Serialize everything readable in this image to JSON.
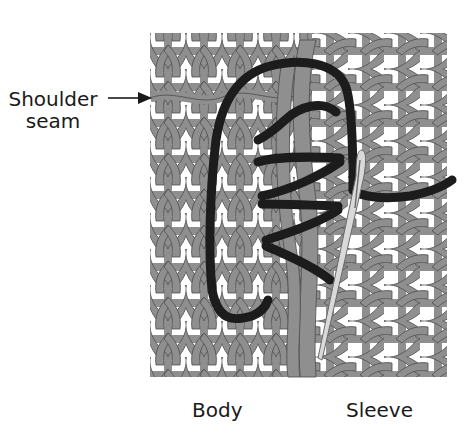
{
  "figure": {
    "labels": {
      "shoulder_line1": "Shoulder",
      "shoulder_line2": "seam",
      "body": "Body",
      "sleeve": "Sleeve"
    },
    "colors": {
      "background": "#ffffff",
      "knit_yarn": "#8f8f8f",
      "knit_outline": "#4a4a4a",
      "seaming_yarn": "#1c1c1c",
      "needle": "#d9d9d9",
      "needle_outline": "#6a6a6a",
      "label_text": "#1a1a1a"
    },
    "regions": {
      "knit_area": {
        "x": 150,
        "y": 33,
        "width": 297,
        "height": 344
      },
      "body_section": {
        "x": 150,
        "width": 165,
        "stitch_orientation": "vertical"
      },
      "sleeve_section": {
        "x": 315,
        "width": 132,
        "stitch_orientation": "horizontal"
      }
    },
    "annotations": [
      {
        "text": "Shoulder seam",
        "arrow_target": [
          152,
          98
        ]
      }
    ]
  }
}
